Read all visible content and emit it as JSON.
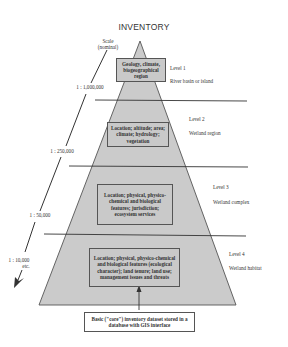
{
  "title": "INVENTORY",
  "scale_axis": {
    "label_line1": "Scale",
    "label_line2": "(nominal)",
    "ticks": [
      "1 : 1,000,000",
      "1 : 250,000",
      "1 : 50,000",
      "1 : 10,000",
      "etc."
    ]
  },
  "levels": [
    {
      "level": "Level 1",
      "unit": "River basin or island",
      "box_text": "Geology, climate, biogeographical region"
    },
    {
      "level": "Level 2",
      "unit": "Wetland region",
      "box_text": "Location; altitude; area; climate; hydrology; vegetation"
    },
    {
      "level": "Level 3",
      "unit": "Wetland complex",
      "box_text": "Location; physical, physico-chemical and biological features; jurisdiction; ecosystem services"
    },
    {
      "level": "Level 4",
      "unit": "Wetland habitat",
      "box_text": "Location; physical, physico-chemical and biological features (ecological character); land tenure; land use; management issues and threats"
    }
  ],
  "core_box": {
    "text": "Basic (\"core\") inventory dataset stored in a database with GIS interface"
  },
  "colors": {
    "pyramid_fill": "#cbcbcb",
    "box_fill": "#c9c9c9",
    "line": "#333333"
  }
}
